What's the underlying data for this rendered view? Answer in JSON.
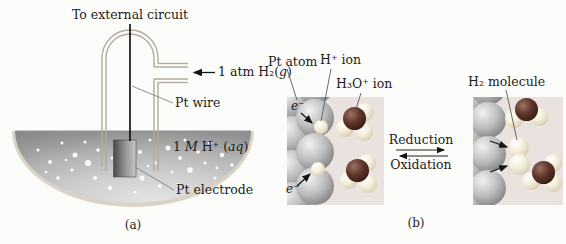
{
  "colors": {
    "panel_background": "#e9e2de",
    "platinum_gray": "#9a9a9a",
    "oxygen_dark_red": "#4a241e",
    "hydrogen_cream": "#efe8d6",
    "solution_silver": "#c2c2c2",
    "line_black": "#1a1a1a"
  },
  "panel_a": {
    "caption": "(a)",
    "external_circuit_label": "To external circuit",
    "h2_gas_label": [
      "1 atm H₂(",
      "g",
      ")"
    ],
    "pt_wire_label": "Pt wire",
    "acid_label": [
      "1 ",
      "M",
      " H⁺ (",
      "aq",
      ")"
    ],
    "pt_electrode_label": "Pt electrode"
  },
  "panel_b": {
    "caption": "(b)",
    "pt_atom_label": "Pt atom",
    "h_ion_label": "H⁺ ion",
    "h3o_ion_label": "H₃O⁺ ion",
    "h2_molecule_label": "H₂ molecule",
    "electron_label_top": "e⁻",
    "electron_label_bottom": "e⁻",
    "reduction_label": "Reduction",
    "oxidation_label": "Oxidation"
  }
}
